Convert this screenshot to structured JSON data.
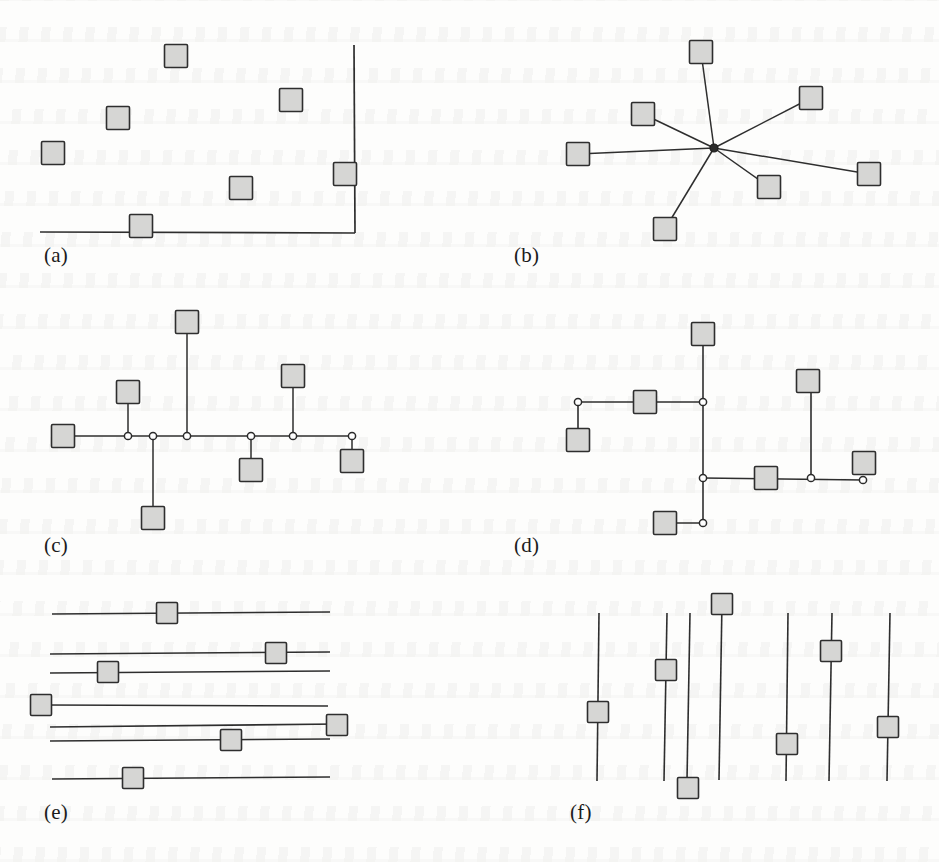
{
  "figure": {
    "background_color": "#fdfdfc",
    "ink_color": "#2e2e2e",
    "node_fill_color": "#d6d6d4",
    "width": 939,
    "height": 862,
    "panel_labels": [
      "(a)",
      "(b)",
      "(c)",
      "(d)",
      "(e)",
      "(f)"
    ]
  },
  "panels": [
    {
      "id": "a",
      "label": "(a)",
      "label_pos": [
        44,
        243
      ],
      "kind": "scatter-with-axes",
      "node_size": 23,
      "axes": [
        {
          "name": "x-axis",
          "x1": 40,
          "y1": 232,
          "x2": 355,
          "y2": 233
        },
        {
          "name": "y-axis",
          "x1": 354,
          "y1": 45,
          "x2": 355,
          "y2": 233
        }
      ],
      "nodes": [
        {
          "cx": 176,
          "cy": 56
        },
        {
          "cx": 291,
          "cy": 100
        },
        {
          "cx": 118,
          "cy": 118
        },
        {
          "cx": 53,
          "cy": 153
        },
        {
          "cx": 345,
          "cy": 174
        },
        {
          "cx": 241,
          "cy": 188
        },
        {
          "cx": 141,
          "cy": 226
        }
      ]
    },
    {
      "id": "b",
      "label": "(b)",
      "label_pos": [
        514,
        243
      ],
      "kind": "star-topology",
      "node_size": 23,
      "hub": {
        "cx": 714,
        "cy": 148,
        "r": 4
      },
      "nodes": [
        {
          "cx": 701,
          "cy": 52
        },
        {
          "cx": 811,
          "cy": 98
        },
        {
          "cx": 643,
          "cy": 114
        },
        {
          "cx": 578,
          "cy": 154
        },
        {
          "cx": 869,
          "cy": 174
        },
        {
          "cx": 769,
          "cy": 187
        },
        {
          "cx": 665,
          "cy": 229
        }
      ],
      "edges": [
        [
          0,
          "hub"
        ],
        [
          1,
          "hub"
        ],
        [
          2,
          "hub"
        ],
        [
          3,
          "hub"
        ],
        [
          4,
          "hub"
        ],
        [
          5,
          "hub"
        ],
        [
          6,
          "hub"
        ]
      ]
    },
    {
      "id": "c",
      "label": "(c)",
      "label_pos": [
        44,
        533
      ],
      "kind": "bus-topology-horizontal",
      "node_size": 23,
      "trunk": {
        "x1": 74,
        "y1": 436,
        "x2": 355,
        "y2": 436
      },
      "junctions": [
        {
          "cx": 128,
          "cy": 436
        },
        {
          "cx": 153,
          "cy": 436
        },
        {
          "cx": 187,
          "cy": 436
        },
        {
          "cx": 251,
          "cy": 436
        },
        {
          "cx": 293,
          "cy": 436
        },
        {
          "cx": 352,
          "cy": 436
        }
      ],
      "nodes": [
        {
          "cx": 63,
          "cy": 436,
          "attach": "trunk-end-left"
        },
        {
          "cx": 128,
          "cy": 392,
          "attach": 0
        },
        {
          "cx": 187,
          "cy": 322,
          "attach": 2
        },
        {
          "cx": 153,
          "cy": 518,
          "attach": 1
        },
        {
          "cx": 251,
          "cy": 470,
          "attach": 3
        },
        {
          "cx": 293,
          "cy": 376,
          "attach": 4
        },
        {
          "cx": 352,
          "cy": 461,
          "attach": 5
        }
      ]
    },
    {
      "id": "d",
      "label": "(d)",
      "label_pos": [
        514,
        533
      ],
      "kind": "tree-topology-orthogonal",
      "node_size": 23,
      "junctions": [
        {
          "cx": 578,
          "cy": 402
        },
        {
          "cx": 703,
          "cy": 402
        },
        {
          "cx": 703,
          "cy": 478
        },
        {
          "cx": 703,
          "cy": 523
        },
        {
          "cx": 811,
          "cy": 478
        },
        {
          "cx": 863,
          "cy": 480
        }
      ],
      "nodes": [
        {
          "cx": 578,
          "cy": 440
        },
        {
          "cx": 645,
          "cy": 402
        },
        {
          "cx": 703,
          "cy": 334
        },
        {
          "cx": 808,
          "cy": 381
        },
        {
          "cx": 766,
          "cy": 478
        },
        {
          "cx": 864,
          "cy": 463
        },
        {
          "cx": 665,
          "cy": 523
        }
      ],
      "segments": [
        {
          "x1": 578,
          "y1": 402,
          "x2": 703,
          "y2": 402
        },
        {
          "x1": 578,
          "y1": 402,
          "x2": 578,
          "y2": 440
        },
        {
          "x1": 703,
          "y1": 334,
          "x2": 703,
          "y2": 523
        },
        {
          "x1": 703,
          "y1": 478,
          "x2": 863,
          "y2": 480
        },
        {
          "x1": 811,
          "y1": 478,
          "x2": 811,
          "y2": 381
        },
        {
          "x1": 665,
          "y1": 523,
          "x2": 703,
          "y2": 523
        }
      ]
    },
    {
      "id": "e",
      "label": "(e)",
      "label_pos": [
        44,
        800
      ],
      "kind": "horizontal-lines-with-nodes",
      "node_size": 21,
      "lines": [
        {
          "x1": 52,
          "y1": 614,
          "x2": 330,
          "y2": 612,
          "node_cx": 167,
          "node_cy": 613
        },
        {
          "x1": 50,
          "y1": 654,
          "x2": 330,
          "y2": 652,
          "node_cx": 276,
          "node_cy": 653
        },
        {
          "x1": 50,
          "y1": 673,
          "x2": 330,
          "y2": 671,
          "node_cx": 108,
          "node_cy": 672
        },
        {
          "x1": 45,
          "y1": 705,
          "x2": 328,
          "y2": 706,
          "node_cx": 41,
          "node_cy": 705
        },
        {
          "x1": 50,
          "y1": 727,
          "x2": 338,
          "y2": 724,
          "node_cx": 337,
          "node_cy": 725
        },
        {
          "x1": 50,
          "y1": 741,
          "x2": 330,
          "y2": 739,
          "node_cx": 231,
          "node_cy": 740
        },
        {
          "x1": 52,
          "y1": 779,
          "x2": 330,
          "y2": 777,
          "node_cx": 133,
          "node_cy": 778
        }
      ]
    },
    {
      "id": "f",
      "label": "(f)",
      "label_pos": [
        570,
        800
      ],
      "kind": "vertical-lines-with-nodes",
      "node_size": 21,
      "lines": [
        {
          "x1": 599,
          "y1": 613,
          "x2": 597,
          "y2": 781,
          "node_cx": 598,
          "node_cy": 712
        },
        {
          "x1": 667,
          "y1": 613,
          "x2": 664,
          "y2": 781,
          "node_cx": 666,
          "node_cy": 670
        },
        {
          "x1": 690,
          "y1": 613,
          "x2": 687,
          "y2": 780,
          "node_cx": 688,
          "node_cy": 788
        },
        {
          "x1": 722,
          "y1": 602,
          "x2": 719,
          "y2": 780,
          "node_cx": 722,
          "node_cy": 604
        },
        {
          "x1": 788,
          "y1": 613,
          "x2": 786,
          "y2": 781,
          "node_cx": 787,
          "node_cy": 744
        },
        {
          "x1": 832,
          "y1": 613,
          "x2": 829,
          "y2": 781,
          "node_cx": 831,
          "node_cy": 651
        },
        {
          "x1": 890,
          "y1": 613,
          "x2": 887,
          "y2": 781,
          "node_cx": 888,
          "node_cy": 727
        }
      ]
    }
  ],
  "chart_data": {
    "type": "diagram",
    "title": "",
    "panels": [
      {
        "label": "(a)",
        "topology": "scatter with L-shaped axes",
        "node_count": 7,
        "link_count": 0
      },
      {
        "label": "(b)",
        "topology": "star",
        "node_count": 7,
        "link_count": 7
      },
      {
        "label": "(c)",
        "topology": "bus / horizontal spine",
        "node_count": 7,
        "link_count": 7
      },
      {
        "label": "(d)",
        "topology": "orthogonal tree",
        "node_count": 7,
        "link_count": 6
      },
      {
        "label": "(e)",
        "topology": "parallel horizontal lines",
        "node_count": 7,
        "link_count": 7
      },
      {
        "label": "(f)",
        "topology": "parallel vertical lines",
        "node_count": 7,
        "link_count": 7
      }
    ]
  }
}
